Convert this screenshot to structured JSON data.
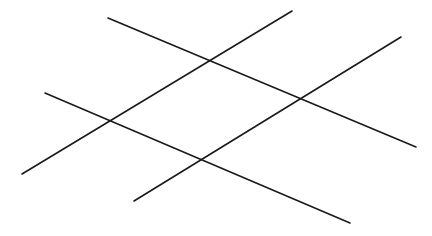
{
  "canvas": {
    "width": 432,
    "height": 236,
    "background_color": "#ffffff",
    "title": "Four intersecting straight lines"
  },
  "style": {
    "line_color": "#1a1a1a",
    "line_width": 1.6,
    "line_cap": "round"
  },
  "chart_data": {
    "type": "line",
    "xlabel": "",
    "ylabel": "",
    "grid": false,
    "legend": "none",
    "xlim": [
      0,
      432
    ],
    "ylim": [
      0,
      236
    ],
    "series": [
      {
        "name": "line-a-descending-lower",
        "direction": "descending",
        "x": [
          45,
          350
        ],
        "y": [
          93,
          223
        ],
        "points": [
          [
            45,
            93
          ],
          [
            350,
            223
          ]
        ],
        "slope": 0.426,
        "length": 331.5
      },
      {
        "name": "line-b-ascending-left",
        "direction": "ascending",
        "x": [
          22,
          292
        ],
        "y": [
          174,
          11
        ],
        "points": [
          [
            22,
            174
          ],
          [
            292,
            11
          ]
        ],
        "slope": -0.604,
        "length": 315.4
      },
      {
        "name": "line-c-descending-upper",
        "direction": "descending",
        "x": [
          108,
          416
        ],
        "y": [
          18,
          147
        ],
        "points": [
          [
            108,
            18
          ],
          [
            416,
            147
          ]
        ],
        "slope": 0.419,
        "length": 333.9
      },
      {
        "name": "line-d-ascending-right",
        "direction": "ascending",
        "x": [
          134,
          401
        ],
        "y": [
          201,
          37
        ],
        "points": [
          [
            134,
            201
          ],
          [
            401,
            37
          ]
        ],
        "slope": -0.614,
        "length": 313.3
      }
    ],
    "intersections": [
      {
        "name": "intersection-top",
        "lines": [
          "line-b-ascending-left",
          "line-c-descending-upper"
        ],
        "x": 208,
        "y": 61
      },
      {
        "name": "intersection-left",
        "lines": [
          "line-a-descending-lower",
          "line-b-ascending-left"
        ],
        "x": 106,
        "y": 124
      },
      {
        "name": "intersection-right",
        "lines": [
          "line-c-descending-upper",
          "line-d-ascending-right"
        ],
        "x": 300,
        "y": 97
      },
      {
        "name": "intersection-bottom",
        "lines": [
          "line-a-descending-lower",
          "line-d-ascending-right"
        ],
        "x": 200,
        "y": 162
      }
    ],
    "endpoints": [
      {
        "name": "endpoint-line-a-start",
        "x": 45,
        "y": 93
      },
      {
        "name": "endpoint-line-a-end",
        "x": 350,
        "y": 223
      },
      {
        "name": "endpoint-line-b-start",
        "x": 22,
        "y": 174
      },
      {
        "name": "endpoint-line-b-end",
        "x": 292,
        "y": 11
      },
      {
        "name": "endpoint-line-c-start",
        "x": 108,
        "y": 18
      },
      {
        "name": "endpoint-line-c-end",
        "x": 416,
        "y": 147
      },
      {
        "name": "endpoint-line-d-start",
        "x": 134,
        "y": 201
      },
      {
        "name": "endpoint-line-d-end",
        "x": 401,
        "y": 37
      }
    ]
  }
}
